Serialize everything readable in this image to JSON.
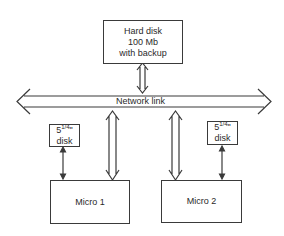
{
  "diagram": {
    "nodes": {
      "hard_disk": {
        "line1": "Hard disk",
        "line2": "100 Mb",
        "line3": "with backup"
      },
      "network": {
        "label": "Network link"
      },
      "disk_left": {
        "size_whole": "5",
        "size_frac": "1/4",
        "inch": "\"",
        "line2": "disk"
      },
      "disk_right": {
        "size_whole": "5",
        "size_frac": "1/4",
        "inch": "\"",
        "line2": "disk"
      },
      "micro1": {
        "label": "Micro 1"
      },
      "micro2": {
        "label": "Micro 2"
      }
    },
    "edges": [
      {
        "from": "hard_disk",
        "to": "network",
        "type": "bidirectional-double"
      },
      {
        "from": "network",
        "to": "micro1",
        "type": "bidirectional-double"
      },
      {
        "from": "network",
        "to": "micro2",
        "type": "bidirectional-double"
      },
      {
        "from": "disk_left",
        "to": "micro1",
        "type": "bidirectional-single"
      },
      {
        "from": "disk_right",
        "to": "micro2",
        "type": "bidirectional-single"
      }
    ],
    "colors": {
      "stroke": "#3a3a3a",
      "background": "#ffffff",
      "text": "#2a2a2a"
    }
  }
}
